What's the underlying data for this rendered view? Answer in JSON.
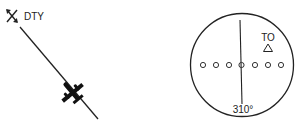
{
  "waypoint": {
    "name": "DTY",
    "icon": "waypoint-x-icon"
  },
  "aircraft": {
    "icon": "airplane-icon"
  },
  "vor_indicator": {
    "to_from_label": "TO",
    "to_from_icon": "triangle-up-icon",
    "course_label": "310°",
    "deflection_dots": 7
  },
  "colors": {
    "ink": "#222222",
    "background": "#ffffff"
  }
}
